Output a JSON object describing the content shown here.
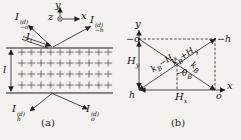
{
  "fig_a": {
    "axis_x": "x",
    "axis_y": "y",
    "axis_z": "z",
    "thickness": "l",
    "incident": {
      "base": "I",
      "sub": "i"
    },
    "refl_o": {
      "base": "I",
      "sup": "(d)",
      "sub": "−o"
    },
    "refl_h": {
      "base": "I",
      "sup": "(d)",
      "sub": "−h"
    },
    "trans_h": {
      "base": "I",
      "sup": "(d)",
      "sub": "h"
    },
    "trans_o": {
      "base": "I",
      "sup": "(d)",
      "sub": "o"
    },
    "caption": "(a)"
  },
  "fig_b": {
    "axis_x": "x",
    "axis_y": "y",
    "corner_tl": "−o",
    "corner_tr": "−h",
    "corner_bl": "h",
    "corner_br": "o",
    "hy": {
      "base": "H",
      "sub": "y"
    },
    "hx": {
      "base": "H",
      "sub": "x"
    },
    "theta": {
      "base": "θ",
      "sub": "B"
    },
    "kb": {
      "base": "k",
      "sub": "B"
    },
    "k_minus": {
      "p1": "k",
      "s1": "B",
      "p2": "−H",
      "s2": "x"
    },
    "k_plus": {
      "p1": "k",
      "s1": "B",
      "p2": "+H",
      "s2": "y"
    },
    "caption": "(b)"
  },
  "colors": {
    "ink": "#1f1f1f",
    "background": "#f3f2ee"
  }
}
